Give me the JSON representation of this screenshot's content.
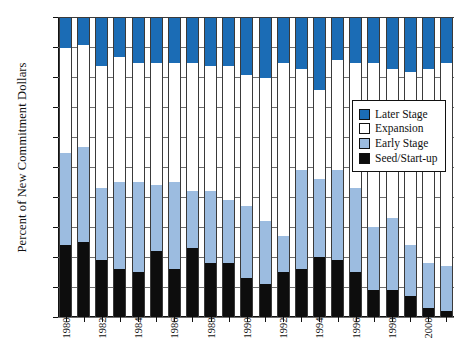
{
  "chart_data": {
    "type": "bar",
    "subtype": "stacked-percent",
    "title": "",
    "xlabel": "",
    "ylabel": "Percent of New Commitment Dollars",
    "ylim": [
      0,
      100
    ],
    "ytick_labels": [
      "0%",
      "10%",
      "20%",
      "30%",
      "40%",
      "50%",
      "60%",
      "70%",
      "80%",
      "90%",
      "100%"
    ],
    "ytick_values": [
      0,
      10,
      20,
      30,
      40,
      50,
      60,
      70,
      80,
      90,
      100
    ],
    "grid": true,
    "legend_position": "inside-right",
    "categories": [
      "1980",
      "1981",
      "1982",
      "1983",
      "1984",
      "1985",
      "1986",
      "1987",
      "1988",
      "1989",
      "1990",
      "1991",
      "1992",
      "1993",
      "1994",
      "1995",
      "1996",
      "1997",
      "1998",
      "1999",
      "2000",
      "2001"
    ],
    "xtick_labels_shown": [
      "1980",
      "1982",
      "1984",
      "1986",
      "1988",
      "1990",
      "1992",
      "1994",
      "1996",
      "1998",
      "2000"
    ],
    "series": [
      {
        "name": "Seed/Start-up",
        "color": "#0d0d0d",
        "values": [
          24,
          25,
          19,
          16,
          15,
          22,
          16,
          23,
          18,
          18,
          13,
          11,
          15,
          16,
          20,
          19,
          15,
          9,
          9,
          7,
          3,
          2
        ]
      },
      {
        "name": "Early Stage",
        "color": "#9cbce0",
        "values": [
          31,
          32,
          24,
          29,
          30,
          22,
          29,
          19,
          24,
          21,
          24,
          21,
          12,
          33,
          26,
          30,
          28,
          21,
          24,
          17,
          15,
          15
        ]
      },
      {
        "name": "Expansion",
        "color": "#ffffff",
        "values": [
          35,
          34,
          41,
          42,
          40,
          41,
          40,
          43,
          42,
          45,
          44,
          48,
          58,
          34,
          30,
          37,
          42,
          55,
          50,
          58,
          65,
          68
        ]
      },
      {
        "name": "Later Stage",
        "color": "#1b6cb5",
        "values": [
          10,
          9,
          16,
          13,
          15,
          15,
          15,
          15,
          16,
          16,
          19,
          20,
          15,
          17,
          24,
          14,
          15,
          15,
          17,
          18,
          17,
          15
        ]
      }
    ]
  },
  "legend": {
    "items": [
      {
        "label": "Later Stage",
        "color": "#1b6cb5"
      },
      {
        "label": "Expansion",
        "color": "#ffffff"
      },
      {
        "label": "Early Stage",
        "color": "#9cbce0"
      },
      {
        "label": "Seed/Start-up",
        "color": "#0d0d0d"
      }
    ]
  }
}
